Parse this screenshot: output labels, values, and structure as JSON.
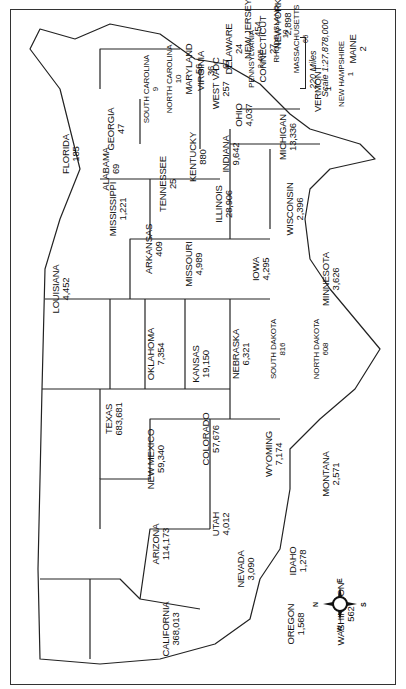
{
  "map": {
    "orientation": "rotated 90 degrees counterclockwise (north points left)",
    "scale": {
      "bar_label": "220 Miles",
      "ratio_label": "Scale 1:27,878,000"
    },
    "compass": {
      "n": "N",
      "e": "E",
      "s": "S",
      "w": "W"
    },
    "states": [
      {
        "id": "washington",
        "name": "Washington",
        "value": "562",
        "x": 75,
        "y": 60
      },
      {
        "id": "oregon",
        "name": "Oregon",
        "value": "1,568",
        "x": 65,
        "y": 110
      },
      {
        "id": "california",
        "name": "California",
        "value": "368,013",
        "x": 60,
        "y": 235
      },
      {
        "id": "idaho",
        "name": "Idaho",
        "value": "1,278",
        "x": 128,
        "y": 108
      },
      {
        "id": "nevada",
        "name": "Nevada",
        "value": "3,090",
        "x": 120,
        "y": 160
      },
      {
        "id": "montana",
        "name": "Montana",
        "value": "2,571",
        "x": 215,
        "y": 75
      },
      {
        "id": "wyoming",
        "name": "Wyoming",
        "value": "7,174",
        "x": 235,
        "y": 132
      },
      {
        "id": "utah",
        "name": "Utah",
        "value": "4,012",
        "x": 165,
        "y": 185
      },
      {
        "id": "arizona",
        "name": "Arizona",
        "value": "114,173",
        "x": 145,
        "y": 245
      },
      {
        "id": "colorado",
        "name": "Colorado",
        "value": "57,676",
        "x": 250,
        "y": 195
      },
      {
        "id": "new-mexico",
        "name": "New Mexico",
        "value": "59,340",
        "x": 230,
        "y": 250
      },
      {
        "id": "north-dakota",
        "name": "North Dakota",
        "value": "608",
        "x": 340,
        "y": 85
      },
      {
        "id": "south-dakota",
        "name": "South Dakota",
        "value": "816",
        "x": 340,
        "y": 128
      },
      {
        "id": "nebraska",
        "name": "Nebraska",
        "value": "6,321",
        "x": 335,
        "y": 165
      },
      {
        "id": "kansas",
        "name": "Kansas",
        "value": "19,150",
        "x": 325,
        "y": 205
      },
      {
        "id": "oklahoma",
        "name": "Oklahoma",
        "value": "7,354",
        "x": 335,
        "y": 250
      },
      {
        "id": "texas",
        "name": "Texas",
        "value": "683,681",
        "x": 270,
        "y": 292
      },
      {
        "id": "minnesota",
        "name": "Minnesota",
        "value": "3,626",
        "x": 410,
        "y": 75
      },
      {
        "id": "iowa",
        "name": "Iowa",
        "value": "4,295",
        "x": 420,
        "y": 145
      },
      {
        "id": "missouri",
        "name": "Missouri",
        "value": "4,989",
        "x": 425,
        "y": 212
      },
      {
        "id": "arkansas",
        "name": "Arkansas",
        "value": "409",
        "x": 440,
        "y": 252
      },
      {
        "id": "louisiana",
        "name": "Louisiana",
        "value": "4,452",
        "x": 400,
        "y": 345
      },
      {
        "id": "wisconsin",
        "name": "Wisconsin",
        "value": "2,396",
        "x": 480,
        "y": 111
      },
      {
        "id": "illinois",
        "name": "Illinois",
        "value": "28,906",
        "x": 485,
        "y": 182
      },
      {
        "id": "michigan",
        "name": "Michigan",
        "value": "13,336",
        "x": 552,
        "y": 118
      },
      {
        "id": "indiana",
        "name": "Indiana",
        "value": "9,642",
        "x": 535,
        "y": 175
      },
      {
        "id": "ohio",
        "name": "Ohio",
        "value": "4,037",
        "x": 574,
        "y": 162
      },
      {
        "id": "kentucky",
        "name": "Kentucky",
        "value": "880",
        "x": 532,
        "y": 208
      },
      {
        "id": "tennessee",
        "name": "Tennessee",
        "value": "25",
        "x": 505,
        "y": 238
      },
      {
        "id": "mississippi",
        "name": "Mississippi",
        "value": "1,221",
        "x": 480,
        "y": 288
      },
      {
        "id": "alabama",
        "name": "Alabama",
        "value": "69",
        "x": 520,
        "y": 295
      },
      {
        "id": "georgia",
        "name": "Georgia",
        "value": "47",
        "x": 560,
        "y": 290
      },
      {
        "id": "florida",
        "name": "Florida",
        "value": "185",
        "x": 535,
        "y": 335
      },
      {
        "id": "south-carolina",
        "name": "South Carolina",
        "value": "9",
        "x": 600,
        "y": 255
      },
      {
        "id": "north-carolina",
        "name": "North Carolina",
        "value": "10",
        "x": 610,
        "y": 232
      },
      {
        "id": "virginia",
        "name": "Virginia",
        "value": "36",
        "x": 618,
        "y": 200
      },
      {
        "id": "west-virginia",
        "name": "West VA",
        "value": "257",
        "x": 600,
        "y": 185
      },
      {
        "id": "pennsylvania",
        "name": "Pennsylvania",
        "value": "3,405",
        "x": 630,
        "y": 150
      },
      {
        "id": "new-york",
        "name": "New York",
        "value": "2,898",
        "x": 665,
        "y": 123
      },
      {
        "id": "vermont",
        "name": "Vermont",
        "value": "1",
        "x": 600,
        "y": 83
      },
      {
        "id": "new-hampshire",
        "name": "New Hampshire",
        "value": "1",
        "x": 615,
        "y": 60
      },
      {
        "id": "maine",
        "name": "Maine",
        "value": "2",
        "x": 640,
        "y": 48
      },
      {
        "id": "massachusetts",
        "name": "Massachusetts",
        "value": "66",
        "x": 650,
        "y": 105
      },
      {
        "id": "rhode-island",
        "name": "Rhode Island",
        "value": "10",
        "x": 655,
        "y": 125
      },
      {
        "id": "connecticut",
        "name": "Connecticut",
        "value": "27",
        "x": 640,
        "y": 138
      },
      {
        "id": "new-jersey",
        "name": "New Jersey",
        "value": "454",
        "x": 660,
        "y": 153
      },
      {
        "id": "delaware",
        "name": "Delaware",
        "value": "24",
        "x": 640,
        "y": 172
      },
      {
        "id": "dc",
        "name": "DC",
        "value": "67",
        "x": 625,
        "y": 185
      },
      {
        "id": "maryland",
        "name": "Maryland",
        "value": "56",
        "x": 620,
        "y": 212
      }
    ]
  }
}
